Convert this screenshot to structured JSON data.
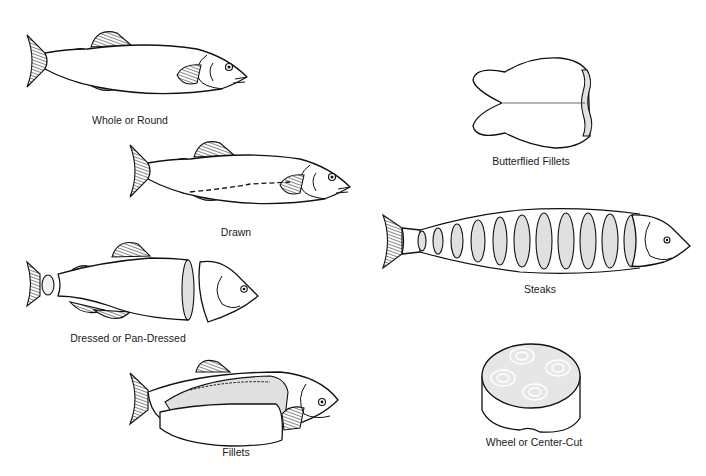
{
  "diagram": {
    "items": [
      {
        "id": "whole",
        "label": "Whole or Round"
      },
      {
        "id": "drawn",
        "label": "Drawn"
      },
      {
        "id": "dressed",
        "label": "Dressed or Pan-Dressed"
      },
      {
        "id": "fillets",
        "label": "Fillets"
      },
      {
        "id": "butterflied",
        "label": "Butterflied Fillets"
      },
      {
        "id": "steaks",
        "label": "Steaks"
      },
      {
        "id": "wheel",
        "label": "Wheel or Center-Cut"
      }
    ],
    "colors": {
      "outline": "#111111",
      "cut_surface": "#e0e0e0",
      "background": "#ffffff"
    }
  }
}
